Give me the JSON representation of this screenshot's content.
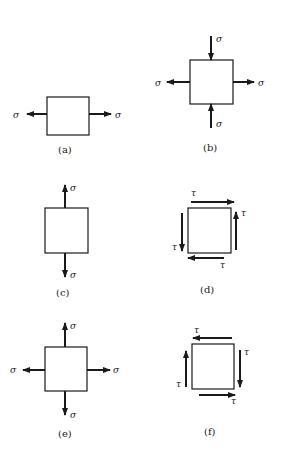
{
  "figure": {
    "panels": [
      {
        "id": "a",
        "caption": "(a)",
        "description": "uniaxial tension, horizontal",
        "labels": {
          "left": "σ",
          "right": "σ"
        }
      },
      {
        "id": "b",
        "caption": "(b)",
        "description": "horizontal tension with vertical compression",
        "labels": {
          "left": "σ",
          "right": "σ",
          "top": "σ",
          "bottom": "σ"
        }
      },
      {
        "id": "c",
        "caption": "(c)",
        "description": "uniaxial tension, vertical",
        "labels": {
          "top": "σ",
          "bottom": "σ"
        }
      },
      {
        "id": "d",
        "caption": "(d)",
        "description": "pure shear",
        "labels": {
          "top": "τ",
          "right": "τ",
          "bottom": "τ",
          "left": "τ"
        }
      },
      {
        "id": "e",
        "caption": "(e)",
        "description": "biaxial tension",
        "labels": {
          "left": "σ",
          "right": "σ",
          "top": "σ",
          "bottom": "σ"
        }
      },
      {
        "id": "f",
        "caption": "(f)",
        "description": "pure shear, reversed",
        "labels": {
          "top": "τ",
          "right": "τ",
          "bottom": "τ",
          "left": "τ"
        }
      }
    ]
  }
}
